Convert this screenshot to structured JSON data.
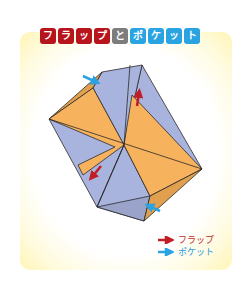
{
  "title": {
    "text": "フラップとポケット",
    "tiles": [
      {
        "char": "フ",
        "color": "red"
      },
      {
        "char": "ラ",
        "color": "red"
      },
      {
        "char": "ッ",
        "color": "red"
      },
      {
        "char": "プ",
        "color": "red"
      },
      {
        "char": "と",
        "color": "gray"
      },
      {
        "char": "ポ",
        "color": "blue"
      },
      {
        "char": "ケ",
        "color": "blue"
      },
      {
        "char": "ッ",
        "color": "blue"
      },
      {
        "char": "ト",
        "color": "blue"
      }
    ]
  },
  "legend": {
    "flap": {
      "label": "フラップ",
      "color": "#c21d24",
      "icon": "red-arrow-icon"
    },
    "pocket": {
      "label": "ポケット",
      "color": "#2aa3e3",
      "icon": "blue-arrow-icon"
    }
  },
  "colors": {
    "orange_face": "#f7b25e",
    "orange_shadow": "#e0a04e",
    "lavender_face": "#a9b4de",
    "lavender_shadow": "#9aa3c9",
    "edge": "#2a2a2a",
    "flap_arrow": "#c21d24",
    "pocket_arrow": "#2aa3e3"
  }
}
